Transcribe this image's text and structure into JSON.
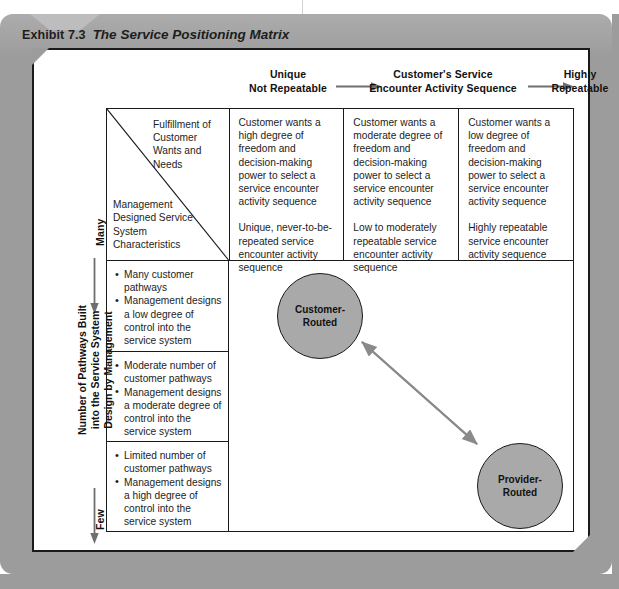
{
  "caption": {
    "number": "Exhibit 7.3",
    "title": "The Service Positioning Matrix"
  },
  "column_axis": {
    "left_label": "Unique\nNot Repeatable",
    "left_label_line1": "Unique",
    "left_label_line2": "Not Repeatable",
    "center_label_line1": "Customer's Service",
    "center_label_line2": "Encounter Activity Sequence",
    "right_label_line1": "Highly",
    "right_label_line2": "Repeatable"
  },
  "row_axis": {
    "top_label": "Many",
    "bottom_label": "Few",
    "main_label_line1": "Number of Pathways Built",
    "main_label_line2": "into the Service System",
    "main_label_line3": "Design by Management"
  },
  "matrix": {
    "corner": {
      "top_text": "Fulfillment of Customer Wants and Needs",
      "bottom_text": "Management Designed Service System Characteristics"
    },
    "column_headers": [
      {
        "paragraph_1": "Customer wants a high degree of freedom and decision-making power to select a service encounter activity sequence",
        "paragraph_2": "Unique, never-to-be-repeated service encounter activity sequence"
      },
      {
        "paragraph_1": "Customer wants a moderate degree of freedom and decision-making power to select a service encounter activity sequence",
        "paragraph_2": "Low to moderately repeatable service encounter activity sequence"
      },
      {
        "paragraph_1": "Customer wants a low degree of freedom and decision-making power to select a service encounter activity sequence",
        "paragraph_2": "Highly repeatable service encounter activity sequence"
      }
    ],
    "row_headers": [
      {
        "bullet_1": "Many customer pathways",
        "bullet_2": "Management designs a low degree of control into the service system"
      },
      {
        "bullet_1": "Moderate number of customer pathways",
        "bullet_2": "Management designs a moderate degree of control into the service system"
      },
      {
        "bullet_1": "Limited number of customer pathways",
        "bullet_2": "Management designs a high degree of control into the service system"
      }
    ]
  },
  "nodes": [
    {
      "name": "customer-routed",
      "line1": "Customer-",
      "line2": "Routed"
    },
    {
      "name": "provider-routed",
      "line1": "Provider-",
      "line2": "Routed"
    }
  ],
  "colors": {
    "panel_grey": "#9c9c9c",
    "node_fill": "#a9a9a9",
    "line_black": "#1a1a1a",
    "arrow_grey": "#808080"
  }
}
